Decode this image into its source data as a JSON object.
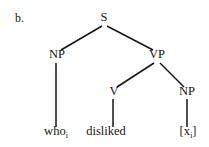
{
  "figure": {
    "enumeration": "b.",
    "type": "syntax-tree",
    "ink_color": "#151515",
    "background_color": "#ffffff"
  },
  "tree": {
    "nodes": [
      {
        "id": "S",
        "label": "S",
        "x": 104,
        "y": 21
      },
      {
        "id": "NP1",
        "label": "NP",
        "x": 57,
        "y": 58
      },
      {
        "id": "VP",
        "label": "VP",
        "x": 157,
        "y": 58
      },
      {
        "id": "V",
        "label": "V",
        "x": 114,
        "y": 95
      },
      {
        "id": "NP2",
        "label": "NP",
        "x": 187,
        "y": 95
      }
    ],
    "terminals": [
      {
        "id": "T1",
        "parent": "NP1",
        "text": "who",
        "subscript": "i",
        "x": 56,
        "y": 135
      },
      {
        "id": "T2",
        "parent": "V",
        "text": "disliked",
        "subscript": "",
        "x": 106,
        "y": 135
      },
      {
        "id": "T3",
        "parent": "NP2",
        "text": "[x",
        "subscript": "i",
        "suffix": "]",
        "x": 188,
        "y": 135
      }
    ],
    "edges": [
      {
        "from": "S",
        "to": "NP1",
        "x1": 102,
        "y1": 26,
        "x2": 61,
        "y2": 50
      },
      {
        "from": "S",
        "to": "VP",
        "x1": 107,
        "y1": 26,
        "x2": 153,
        "y2": 50
      },
      {
        "from": "VP",
        "to": "V",
        "x1": 154,
        "y1": 63,
        "x2": 117,
        "y2": 87
      },
      {
        "from": "VP",
        "to": "NP2",
        "x1": 160,
        "y1": 63,
        "x2": 184,
        "y2": 87
      },
      {
        "from": "NP1",
        "to": "T1",
        "x1": 56,
        "y1": 63,
        "x2": 56,
        "y2": 127
      },
      {
        "from": "V",
        "to": "T2",
        "x1": 113,
        "y1": 99,
        "x2": 113,
        "y2": 127
      },
      {
        "from": "NP2",
        "to": "T3",
        "x1": 187,
        "y1": 99,
        "x2": 187,
        "y2": 127
      }
    ]
  }
}
